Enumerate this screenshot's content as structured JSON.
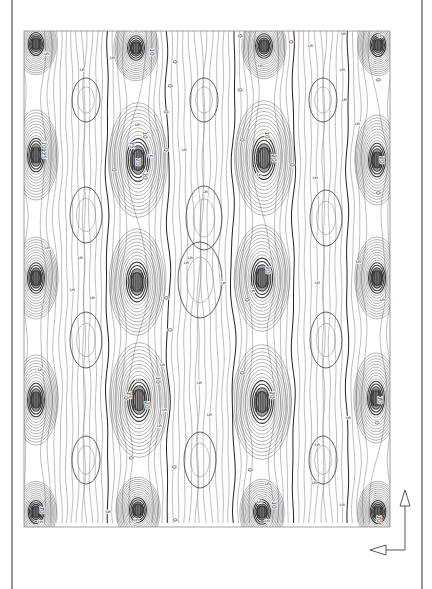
{
  "chart_data": {
    "type": "contour",
    "title": "",
    "xlabel": "",
    "ylabel": "",
    "orientation": "rotated 90° (labels read vertically)",
    "grid": false,
    "legend": null,
    "plot_box": {
      "x0": 24,
      "y0": 31,
      "x1": 390,
      "y1": 527
    },
    "contour_levels": [
      -5,
      0,
      5,
      10,
      15,
      20
    ],
    "contour_labels_seen": [
      "-5",
      "0",
      "5",
      "10",
      "15",
      "20"
    ],
    "sources": [
      {
        "x": 36,
        "y": 44,
        "strength": 1.0,
        "rx": 11,
        "ry": 15
      },
      {
        "x": 136,
        "y": 48,
        "strength": 1.0,
        "rx": 12,
        "ry": 16
      },
      {
        "x": 264,
        "y": 46,
        "strength": 1.0,
        "rx": 12,
        "ry": 16
      },
      {
        "x": 378,
        "y": 45,
        "strength": 1.0,
        "rx": 11,
        "ry": 15
      },
      {
        "x": 36,
        "y": 155,
        "strength": 1.0,
        "rx": 12,
        "ry": 22
      },
      {
        "x": 138,
        "y": 160,
        "strength": 1.3,
        "rx": 16,
        "ry": 28
      },
      {
        "x": 264,
        "y": 158,
        "strength": 1.3,
        "rx": 16,
        "ry": 28
      },
      {
        "x": 377,
        "y": 160,
        "strength": 1.1,
        "rx": 12,
        "ry": 22
      },
      {
        "x": 36,
        "y": 278,
        "strength": 1.0,
        "rx": 12,
        "ry": 20
      },
      {
        "x": 137,
        "y": 282,
        "strength": 1.2,
        "rx": 15,
        "ry": 26
      },
      {
        "x": 262,
        "y": 278,
        "strength": 1.2,
        "rx": 15,
        "ry": 26
      },
      {
        "x": 377,
        "y": 278,
        "strength": 1.0,
        "rx": 12,
        "ry": 20
      },
      {
        "x": 36,
        "y": 400,
        "strength": 1.0,
        "rx": 12,
        "ry": 22
      },
      {
        "x": 139,
        "y": 400,
        "strength": 1.3,
        "rx": 16,
        "ry": 28
      },
      {
        "x": 262,
        "y": 402,
        "strength": 1.3,
        "rx": 16,
        "ry": 28
      },
      {
        "x": 376,
        "y": 398,
        "strength": 1.1,
        "rx": 12,
        "ry": 22
      },
      {
        "x": 36,
        "y": 512,
        "strength": 1.0,
        "rx": 11,
        "ry": 15
      },
      {
        "x": 138,
        "y": 510,
        "strength": 1.0,
        "rx": 12,
        "ry": 16
      },
      {
        "x": 262,
        "y": 512,
        "strength": 1.0,
        "rx": 12,
        "ry": 16
      },
      {
        "x": 378,
        "y": 512,
        "strength": 1.0,
        "rx": 11,
        "ry": 15
      }
    ],
    "lows": [
      {
        "x": 86,
        "y": 100,
        "rx": 14,
        "ry": 22
      },
      {
        "x": 204,
        "y": 100,
        "rx": 14,
        "ry": 22
      },
      {
        "x": 323,
        "y": 100,
        "rx": 14,
        "ry": 22
      },
      {
        "x": 86,
        "y": 215,
        "rx": 16,
        "ry": 28
      },
      {
        "x": 204,
        "y": 218,
        "rx": 18,
        "ry": 32
      },
      {
        "x": 326,
        "y": 218,
        "rx": 16,
        "ry": 28
      },
      {
        "x": 86,
        "y": 340,
        "rx": 16,
        "ry": 28
      },
      {
        "x": 200,
        "y": 280,
        "rx": 22,
        "ry": 38
      },
      {
        "x": 326,
        "y": 340,
        "rx": 16,
        "ry": 28
      },
      {
        "x": 86,
        "y": 460,
        "rx": 14,
        "ry": 24
      },
      {
        "x": 200,
        "y": 460,
        "rx": 16,
        "ry": 28
      },
      {
        "x": 323,
        "y": 460,
        "rx": 14,
        "ry": 24
      }
    ],
    "zero_lines_x": [
      24,
      112,
      164,
      238,
      290,
      352
    ],
    "label_positions": [
      {
        "x": 44,
        "y": 54,
        "t": "5"
      },
      {
        "x": 150,
        "y": 52,
        "t": "10"
      },
      {
        "x": 110,
        "y": 58,
        "t": "5"
      },
      {
        "x": 173,
        "y": 62,
        "t": "0"
      },
      {
        "x": 80,
        "y": 70,
        "t": "5"
      },
      {
        "x": 238,
        "y": 36,
        "t": "0"
      },
      {
        "x": 289,
        "y": 42,
        "t": "0"
      },
      {
        "x": 258,
        "y": 66,
        "t": "5"
      },
      {
        "x": 308,
        "y": 46,
        "t": "5"
      },
      {
        "x": 341,
        "y": 34,
        "t": "5"
      },
      {
        "x": 378,
        "y": 36,
        "t": "5"
      },
      {
        "x": 376,
        "y": 80,
        "t": "0"
      },
      {
        "x": 340,
        "y": 70,
        "t": "5"
      },
      {
        "x": 342,
        "y": 100,
        "t": "5"
      },
      {
        "x": 168,
        "y": 86,
        "t": "0"
      },
      {
        "x": 164,
        "y": 112,
        "t": "0"
      },
      {
        "x": 238,
        "y": 90,
        "t": "0"
      },
      {
        "x": 135,
        "y": 125,
        "t": "5"
      },
      {
        "x": 143,
        "y": 135,
        "t": "10"
      },
      {
        "x": 130,
        "y": 145,
        "t": "15"
      },
      {
        "x": 136,
        "y": 162,
        "t": "20"
      },
      {
        "x": 148,
        "y": 155,
        "t": "-5"
      },
      {
        "x": 143,
        "y": 175,
        "t": "-10"
      },
      {
        "x": 112,
        "y": 170,
        "t": "0"
      },
      {
        "x": 164,
        "y": 150,
        "t": "0"
      },
      {
        "x": 182,
        "y": 150,
        "t": "5"
      },
      {
        "x": 203,
        "y": 192,
        "t": "5"
      },
      {
        "x": 20,
        "y": 150,
        "t": "-"
      },
      {
        "x": 42,
        "y": 145,
        "t": "10"
      },
      {
        "x": 42,
        "y": 155,
        "t": "15"
      },
      {
        "x": 265,
        "y": 135,
        "t": "10"
      },
      {
        "x": 272,
        "y": 158,
        "t": "20"
      },
      {
        "x": 240,
        "y": 140,
        "t": "0"
      },
      {
        "x": 257,
        "y": 175,
        "t": "5"
      },
      {
        "x": 290,
        "y": 165,
        "t": "0"
      },
      {
        "x": 313,
        "y": 178,
        "t": "5"
      },
      {
        "x": 380,
        "y": 160,
        "t": "20"
      },
      {
        "x": 355,
        "y": 124,
        "t": "5"
      },
      {
        "x": 376,
        "y": 193,
        "t": "0"
      },
      {
        "x": 45,
        "y": 248,
        "t": "5"
      },
      {
        "x": 78,
        "y": 258,
        "t": "5"
      },
      {
        "x": 70,
        "y": 290,
        "t": "5"
      },
      {
        "x": 90,
        "y": 298,
        "t": "5"
      },
      {
        "x": 188,
        "y": 258,
        "t": "5"
      },
      {
        "x": 184,
        "y": 263,
        "t": "5"
      },
      {
        "x": 221,
        "y": 282,
        "t": "-5"
      },
      {
        "x": 266,
        "y": 270,
        "t": "20"
      },
      {
        "x": 250,
        "y": 290,
        "t": "-5"
      },
      {
        "x": 164,
        "y": 298,
        "t": "0"
      },
      {
        "x": 168,
        "y": 330,
        "t": "0"
      },
      {
        "x": 245,
        "y": 300,
        "t": "0"
      },
      {
        "x": 315,
        "y": 283,
        "t": "5"
      },
      {
        "x": 356,
        "y": 262,
        "t": "5"
      },
      {
        "x": 380,
        "y": 300,
        "t": "5"
      },
      {
        "x": 38,
        "y": 370,
        "t": "5"
      },
      {
        "x": 136,
        "y": 380,
        "t": "5"
      },
      {
        "x": 160,
        "y": 365,
        "t": "5"
      },
      {
        "x": 156,
        "y": 380,
        "t": "10"
      },
      {
        "x": 127,
        "y": 395,
        "t": "15"
      },
      {
        "x": 145,
        "y": 405,
        "t": "20"
      },
      {
        "x": 162,
        "y": 410,
        "t": "5"
      },
      {
        "x": 157,
        "y": 426,
        "t": "5"
      },
      {
        "x": 124,
        "y": 398,
        "t": "0"
      },
      {
        "x": 197,
        "y": 383,
        "t": "5"
      },
      {
        "x": 207,
        "y": 415,
        "t": "5"
      },
      {
        "x": 129,
        "y": 458,
        "t": "0"
      },
      {
        "x": 172,
        "y": 467,
        "t": "0"
      },
      {
        "x": 240,
        "y": 373,
        "t": "0"
      },
      {
        "x": 270,
        "y": 395,
        "t": "20"
      },
      {
        "x": 248,
        "y": 470,
        "t": "0"
      },
      {
        "x": 265,
        "y": 484,
        "t": "5"
      },
      {
        "x": 257,
        "y": 502,
        "t": "5"
      },
      {
        "x": 272,
        "y": 505,
        "t": "10"
      },
      {
        "x": 315,
        "y": 445,
        "t": "5"
      },
      {
        "x": 312,
        "y": 483,
        "t": "5"
      },
      {
        "x": 346,
        "y": 418,
        "t": "5"
      },
      {
        "x": 378,
        "y": 400,
        "t": "10"
      },
      {
        "x": 375,
        "y": 423,
        "t": "0"
      },
      {
        "x": 40,
        "y": 510,
        "t": "10"
      },
      {
        "x": 38,
        "y": 522,
        "t": "5"
      },
      {
        "x": 106,
        "y": 512,
        "t": "5"
      },
      {
        "x": 134,
        "y": 520,
        "t": "5"
      },
      {
        "x": 173,
        "y": 520,
        "t": "0"
      },
      {
        "x": 265,
        "y": 521,
        "t": "5"
      },
      {
        "x": 340,
        "y": 505,
        "t": "5"
      },
      {
        "x": 377,
        "y": 519,
        "t": "10"
      }
    ],
    "axis_indicator": {
      "corner": {
        "x": 405,
        "y": 550
      },
      "up_arrow_tip": {
        "x": 405,
        "y": 490
      },
      "left_arrow_tip": {
        "x": 370,
        "y": 550
      }
    },
    "frame": {
      "left_x": 12,
      "right_x": 422
    }
  },
  "colors": {
    "line": "#3a3a3a",
    "line_light": "#8a8a8a",
    "blob": "#222222",
    "frame": "#555555",
    "background": "#ffffff"
  }
}
